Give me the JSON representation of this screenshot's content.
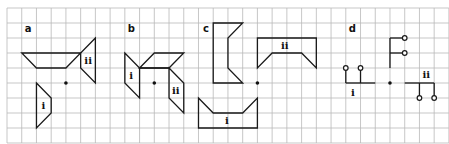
{
  "grid": {
    "origin_x": 7,
    "origin_y": 8,
    "cell_w": 14.73,
    "cell_h": 15,
    "cols": 30,
    "rows": 9,
    "line_color": "#b9b9b9"
  },
  "panels": [
    {
      "id": "a",
      "label": "a",
      "label_pos": [
        1.2,
        1.6
      ],
      "centre": [
        4,
        5
      ],
      "shapes": [
        {
          "name": "trapezoid-top",
          "points": [
            [
              1,
              3
            ],
            [
              5,
              3
            ],
            [
              4,
              4
            ],
            [
              2,
              4
            ]
          ]
        },
        {
          "name": "shape-ii",
          "label": "ii",
          "label_pos": [
            5.25,
            3.75
          ],
          "points": [
            [
              6,
              2
            ],
            [
              5,
              3
            ],
            [
              5,
              4
            ],
            [
              6,
              5
            ]
          ]
        },
        {
          "name": "shape-i",
          "label": "i",
          "label_pos": [
            2.35,
            6.75
          ],
          "points": [
            [
              2,
              5
            ],
            [
              3,
              6
            ],
            [
              3,
              7
            ],
            [
              2,
              8
            ]
          ]
        }
      ]
    },
    {
      "id": "b",
      "label": "b",
      "label_pos": [
        8.2,
        1.6
      ],
      "centre": [
        10,
        5
      ],
      "shapes": [
        {
          "name": "shape-i",
          "label": "i",
          "label_pos": [
            8.3,
            4.7
          ],
          "points": [
            [
              8,
              3
            ],
            [
              9,
              4
            ],
            [
              9,
              6
            ],
            [
              8,
              5
            ]
          ]
        },
        {
          "name": "shape-top",
          "points": [
            [
              9,
              4
            ],
            [
              10,
              3
            ],
            [
              12,
              3
            ],
            [
              11,
              4
            ]
          ]
        },
        {
          "name": "shape-ii",
          "label": "ii",
          "label_pos": [
            11.2,
            5.75
          ],
          "points": [
            [
              11,
              4
            ],
            [
              12,
              5
            ],
            [
              12,
              7
            ],
            [
              11,
              6
            ]
          ]
        }
      ],
      "segments": [
        [
          [
            9,
            4
          ],
          [
            11,
            4
          ]
        ]
      ]
    },
    {
      "id": "c",
      "label": "c",
      "label_pos": [
        13.3,
        1.6
      ],
      "centre": [
        17,
        5
      ],
      "shapes": [
        {
          "name": "shape-tall",
          "points": [
            [
              14,
              1
            ],
            [
              16,
              1
            ],
            [
              15,
              2
            ],
            [
              15,
              4
            ],
            [
              16,
              5
            ],
            [
              14,
              5
            ]
          ]
        },
        {
          "name": "shape-ii",
          "label": "ii",
          "label_pos": [
            18.6,
            2.7
          ],
          "points": [
            [
              17,
              2
            ],
            [
              21,
              2
            ],
            [
              21,
              4
            ],
            [
              20,
              3
            ],
            [
              18,
              3
            ],
            [
              17,
              4
            ]
          ]
        },
        {
          "name": "shape-i",
          "label": "i",
          "label_pos": [
            14.8,
            7.75
          ],
          "points": [
            [
              13,
              6
            ],
            [
              14,
              7
            ],
            [
              16,
              7
            ],
            [
              17,
              6
            ],
            [
              17,
              8
            ],
            [
              13,
              8
            ]
          ]
        }
      ]
    },
    {
      "id": "d",
      "label": "d",
      "label_pos": [
        23.2,
        1.6
      ],
      "centre": [
        26,
        5
      ],
      "segments": [
        [
          [
            26,
            2
          ],
          [
            26,
            4
          ]
        ],
        [
          [
            26,
            2
          ],
          [
            27,
            2
          ]
        ],
        [
          [
            26,
            3
          ],
          [
            27,
            3
          ]
        ],
        [
          [
            23,
            4
          ],
          [
            23,
            5
          ]
        ],
        [
          [
            24,
            4
          ],
          [
            24,
            5
          ]
        ],
        [
          [
            23,
            5
          ],
          [
            25,
            5
          ]
        ],
        [
          [
            27,
            5
          ],
          [
            29,
            5
          ]
        ],
        [
          [
            28,
            5
          ],
          [
            28,
            6
          ]
        ],
        [
          [
            29,
            5
          ],
          [
            29,
            6
          ]
        ]
      ],
      "knobs": [
        [
          27,
          2
        ],
        [
          27,
          3
        ],
        [
          23,
          4
        ],
        [
          24,
          4
        ],
        [
          28,
          6
        ],
        [
          29,
          6
        ]
      ],
      "shape_labels": [
        {
          "label": "i",
          "label_pos": [
            23.35,
            5.85
          ]
        },
        {
          "label": "ii",
          "label_pos": [
            28.2,
            4.65
          ]
        }
      ]
    }
  ]
}
